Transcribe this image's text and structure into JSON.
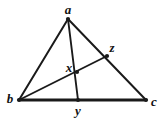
{
  "figure": {
    "type": "geometry-diagram",
    "background_color": "#ffffff",
    "stroke_color": "#1a1a1a",
    "width": 162,
    "height": 119,
    "labels": {
      "a": "a",
      "b": "b",
      "c": "c",
      "x": "x",
      "y": "y",
      "z": "z"
    },
    "points": [
      {
        "id": "a",
        "label": "a",
        "x": 68,
        "y": 19,
        "label_x": 68,
        "label_y": 9,
        "role": "apex-vertex",
        "marker": true
      },
      {
        "id": "b",
        "label": "b",
        "x": 19,
        "y": 100,
        "label_x": 10,
        "label_y": 98,
        "role": "left-vertex",
        "marker": true
      },
      {
        "id": "c",
        "label": "c",
        "x": 146,
        "y": 100,
        "label_x": 154,
        "label_y": 101,
        "role": "right-vertex",
        "marker": true
      },
      {
        "id": "z",
        "label": "z",
        "x": 107,
        "y": 56,
        "label_x": 112,
        "label_y": 47,
        "role": "point-on-ac",
        "marker": true
      },
      {
        "id": "x",
        "label": "x",
        "x": 77,
        "y": 72,
        "label_x": 69,
        "label_y": 67,
        "role": "intersection",
        "marker": true
      },
      {
        "id": "y",
        "label": "y",
        "x": 78,
        "y": 100,
        "label_x": 78,
        "label_y": 110,
        "role": "point-on-bc",
        "marker": true
      }
    ],
    "segments": [
      {
        "id": "ab",
        "from": "a",
        "to": "b",
        "width": 2.0,
        "name": "side-ab"
      },
      {
        "id": "ac",
        "from": "a",
        "to": "c",
        "width": 2.0,
        "name": "side-ac"
      },
      {
        "id": "bc",
        "from": "b",
        "to": "c",
        "width": 2.8,
        "name": "side-bc"
      },
      {
        "id": "ay",
        "from": "a",
        "to": "y",
        "width": 1.9,
        "name": "cevian-ay"
      },
      {
        "id": "bz",
        "from": "b",
        "to": "z",
        "width": 1.9,
        "name": "cevian-bz"
      }
    ]
  }
}
